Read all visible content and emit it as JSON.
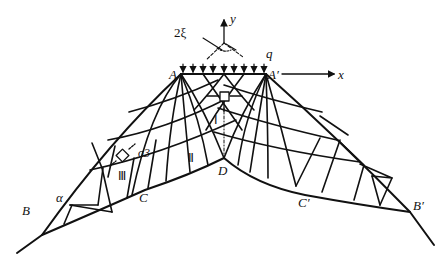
{
  "diagram": {
    "type": "slip-line field under strip load (Prandtl mechanism)",
    "axes": {
      "x_label": "x",
      "y_label": "y"
    },
    "load_label": "q",
    "angle_label": "2ξ",
    "stress_label": "σ3",
    "points": {
      "A": "A",
      "A_prime": "A′",
      "B": "B",
      "B_prime": "B′",
      "C": "C",
      "C_prime": "C′",
      "D": "D"
    },
    "angle_alpha": "α",
    "zones": [
      "Ⅰ",
      "Ⅱ",
      "Ⅲ"
    ],
    "colors": {
      "stroke": "#111111",
      "background": "#ffffff"
    }
  }
}
